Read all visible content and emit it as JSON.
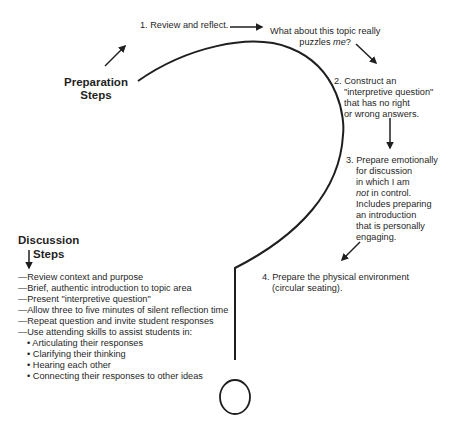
{
  "preparation": {
    "title_line1": "Preparation",
    "title_line2": "Steps",
    "step1": "1. Review and reflect.",
    "reflection_line1": "What about this topic really",
    "reflection_line2_pre": "puzzles ",
    "reflection_line2_em": "me",
    "reflection_line2_post": "?",
    "step2": [
      "2. Construct an",
      "\"interpretive question\"",
      "that has no right",
      "or wrong answers."
    ],
    "step3_first": "3. Prepare emotionally",
    "step3_lines": [
      "for discussion",
      "in which I am"
    ],
    "step3_not_em": "not",
    "step3_not_rest": " in control.",
    "step3_more": [
      "Includes preparing",
      "an introduction",
      "that is personally",
      "engaging."
    ],
    "step4_line1": "4. Prepare the physical environment",
    "step4_line2": "(circular seating)."
  },
  "discussion": {
    "title_line1": "Discussion",
    "title_line2": "Steps",
    "items": [
      "—Review context and purpose",
      "—Brief, authentic introduction to topic area",
      "—Present \"interpretive question\"",
      "—Allow three to five minutes of silent reflection time",
      "—Repeat question and invite student responses",
      "—Use attending skills to assist students in:"
    ],
    "bullets": [
      "• Articulating their responses",
      "• Clarifying their thinking",
      "• Hearing each other",
      "• Connecting their responses to other ideas"
    ]
  }
}
